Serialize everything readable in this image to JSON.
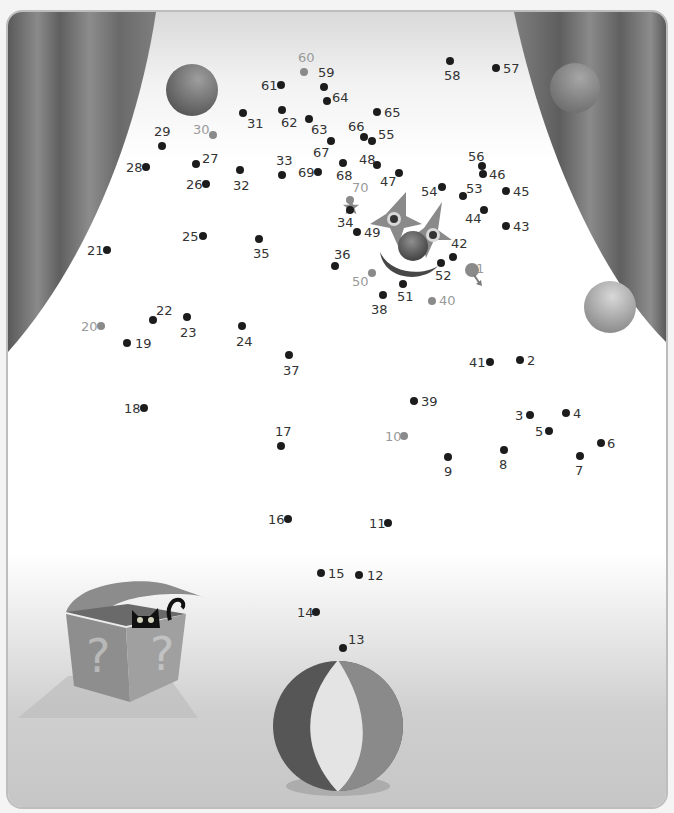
{
  "puzzle": {
    "type": "connect-the-dots",
    "total_dots": 70,
    "colors": {
      "dot": "#1c1c1c",
      "milestone_dot": "#8a8a8a",
      "label": "#333333",
      "milestone_label": "#9a9a9a"
    },
    "dots": [
      {
        "n": "1",
        "x": 472,
        "y": 268,
        "lx": 476,
        "ly": 262,
        "grey": true,
        "start": true
      },
      {
        "n": "2",
        "x": 520,
        "y": 360,
        "lx": 527,
        "ly": 354
      },
      {
        "n": "3",
        "x": 530,
        "y": 415,
        "lx": 515,
        "ly": 409
      },
      {
        "n": "4",
        "x": 566,
        "y": 413,
        "lx": 573,
        "ly": 407
      },
      {
        "n": "5",
        "x": 549,
        "y": 431,
        "lx": 535,
        "ly": 425
      },
      {
        "n": "6",
        "x": 601,
        "y": 443,
        "lx": 607,
        "ly": 437
      },
      {
        "n": "7",
        "x": 580,
        "y": 456,
        "lx": 575,
        "ly": 464
      },
      {
        "n": "8",
        "x": 504,
        "y": 450,
        "lx": 499,
        "ly": 458
      },
      {
        "n": "9",
        "x": 448,
        "y": 457,
        "lx": 444,
        "ly": 465
      },
      {
        "n": "10",
        "x": 404,
        "y": 436,
        "lx": 385,
        "ly": 430,
        "grey": true
      },
      {
        "n": "11",
        "x": 388,
        "y": 523,
        "lx": 369,
        "ly": 517
      },
      {
        "n": "12",
        "x": 359,
        "y": 575,
        "lx": 367,
        "ly": 569
      },
      {
        "n": "13",
        "x": 343,
        "y": 648,
        "lx": 348,
        "ly": 633
      },
      {
        "n": "14",
        "x": 316,
        "y": 612,
        "lx": 297,
        "ly": 606
      },
      {
        "n": "15",
        "x": 321,
        "y": 573,
        "lx": 328,
        "ly": 567
      },
      {
        "n": "16",
        "x": 288,
        "y": 519,
        "lx": 268,
        "ly": 513
      },
      {
        "n": "17",
        "x": 281,
        "y": 446,
        "lx": 275,
        "ly": 425
      },
      {
        "n": "18",
        "x": 144,
        "y": 408,
        "lx": 124,
        "ly": 402
      },
      {
        "n": "19",
        "x": 127,
        "y": 343,
        "lx": 135,
        "ly": 337
      },
      {
        "n": "20",
        "x": 101,
        "y": 326,
        "lx": 81,
        "ly": 320,
        "grey": true
      },
      {
        "n": "21",
        "x": 107,
        "y": 250,
        "lx": 87,
        "ly": 244
      },
      {
        "n": "22",
        "x": 153,
        "y": 320,
        "lx": 156,
        "ly": 304
      },
      {
        "n": "23",
        "x": 187,
        "y": 317,
        "lx": 180,
        "ly": 326
      },
      {
        "n": "24",
        "x": 242,
        "y": 326,
        "lx": 236,
        "ly": 335
      },
      {
        "n": "25",
        "x": 203,
        "y": 236,
        "lx": 182,
        "ly": 230
      },
      {
        "n": "26",
        "x": 206,
        "y": 184,
        "lx": 186,
        "ly": 178
      },
      {
        "n": "27",
        "x": 196,
        "y": 164,
        "lx": 202,
        "ly": 152
      },
      {
        "n": "28",
        "x": 146,
        "y": 167,
        "lx": 126,
        "ly": 161
      },
      {
        "n": "29",
        "x": 162,
        "y": 146,
        "lx": 154,
        "ly": 125
      },
      {
        "n": "30",
        "x": 213,
        "y": 135,
        "lx": 193,
        "ly": 123,
        "grey": true
      },
      {
        "n": "31",
        "x": 243,
        "y": 113,
        "lx": 247,
        "ly": 117
      },
      {
        "n": "32",
        "x": 240,
        "y": 170,
        "lx": 233,
        "ly": 179
      },
      {
        "n": "33",
        "x": 282,
        "y": 175,
        "lx": 276,
        "ly": 154
      },
      {
        "n": "34",
        "x": 350,
        "y": 210,
        "lx": 337,
        "ly": 216
      },
      {
        "n": "35",
        "x": 259,
        "y": 239,
        "lx": 253,
        "ly": 247
      },
      {
        "n": "36",
        "x": 335,
        "y": 266,
        "lx": 334,
        "ly": 248
      },
      {
        "n": "37",
        "x": 289,
        "y": 355,
        "lx": 283,
        "ly": 364
      },
      {
        "n": "38",
        "x": 383,
        "y": 295,
        "lx": 371,
        "ly": 303
      },
      {
        "n": "39",
        "x": 414,
        "y": 401,
        "lx": 421,
        "ly": 395
      },
      {
        "n": "40",
        "x": 432,
        "y": 301,
        "lx": 439,
        "ly": 294,
        "grey": true
      },
      {
        "n": "41",
        "x": 490,
        "y": 362,
        "lx": 469,
        "ly": 356
      },
      {
        "n": "42",
        "x": 453,
        "y": 257,
        "lx": 451,
        "ly": 237
      },
      {
        "n": "43",
        "x": 506,
        "y": 226,
        "lx": 513,
        "ly": 220
      },
      {
        "n": "44",
        "x": 484,
        "y": 210,
        "lx": 465,
        "ly": 212
      },
      {
        "n": "45",
        "x": 506,
        "y": 191,
        "lx": 513,
        "ly": 185
      },
      {
        "n": "46",
        "x": 483,
        "y": 174,
        "lx": 489,
        "ly": 168
      },
      {
        "n": "47",
        "x": 399,
        "y": 173,
        "lx": 380,
        "ly": 175
      },
      {
        "n": "48",
        "x": 377,
        "y": 165,
        "lx": 359,
        "ly": 153
      },
      {
        "n": "49",
        "x": 357,
        "y": 232,
        "lx": 364,
        "ly": 226
      },
      {
        "n": "50",
        "x": 372,
        "y": 273,
        "lx": 352,
        "ly": 275,
        "grey": true
      },
      {
        "n": "51",
        "x": 403,
        "y": 284,
        "lx": 397,
        "ly": 290
      },
      {
        "n": "52",
        "x": 441,
        "y": 263,
        "lx": 435,
        "ly": 269
      },
      {
        "n": "53",
        "x": 463,
        "y": 196,
        "lx": 466,
        "ly": 182
      },
      {
        "n": "54",
        "x": 442,
        "y": 187,
        "lx": 421,
        "ly": 185
      },
      {
        "n": "55",
        "x": 372,
        "y": 141,
        "lx": 378,
        "ly": 128
      },
      {
        "n": "56",
        "x": 482,
        "y": 166,
        "lx": 468,
        "ly": 150
      },
      {
        "n": "57",
        "x": 496,
        "y": 68,
        "lx": 503,
        "ly": 62
      },
      {
        "n": "58",
        "x": 450,
        "y": 61,
        "lx": 444,
        "ly": 69
      },
      {
        "n": "59",
        "x": 324,
        "y": 87,
        "lx": 318,
        "ly": 66
      },
      {
        "n": "60",
        "x": 304,
        "y": 72,
        "lx": 298,
        "ly": 51,
        "grey": true
      },
      {
        "n": "61",
        "x": 281,
        "y": 85,
        "lx": 261,
        "ly": 79
      },
      {
        "n": "62",
        "x": 282,
        "y": 110,
        "lx": 281,
        "ly": 116
      },
      {
        "n": "63",
        "x": 309,
        "y": 119,
        "lx": 311,
        "ly": 123
      },
      {
        "n": "64",
        "x": 327,
        "y": 101,
        "lx": 332,
        "ly": 91
      },
      {
        "n": "65",
        "x": 377,
        "y": 112,
        "lx": 384,
        "ly": 106
      },
      {
        "n": "66",
        "x": 364,
        "y": 137,
        "lx": 348,
        "ly": 120
      },
      {
        "n": "67",
        "x": 331,
        "y": 141,
        "lx": 313,
        "ly": 146
      },
      {
        "n": "68",
        "x": 343,
        "y": 163,
        "lx": 336,
        "ly": 169
      },
      {
        "n": "69",
        "x": 318,
        "y": 172,
        "lx": 298,
        "ly": 166
      },
      {
        "n": "70",
        "x": 350,
        "y": 200,
        "lx": 352,
        "ly": 181,
        "grey": true,
        "end": true
      }
    ]
  },
  "scene": {
    "elements": [
      "left-curtain",
      "right-curtain",
      "red-ball-top-left",
      "red-ball-right-curtain",
      "yellow-ball-right-curtain",
      "clown-face",
      "mystery-box",
      "black-cat",
      "beach-ball"
    ],
    "box_symbols": [
      "?",
      "?"
    ]
  }
}
